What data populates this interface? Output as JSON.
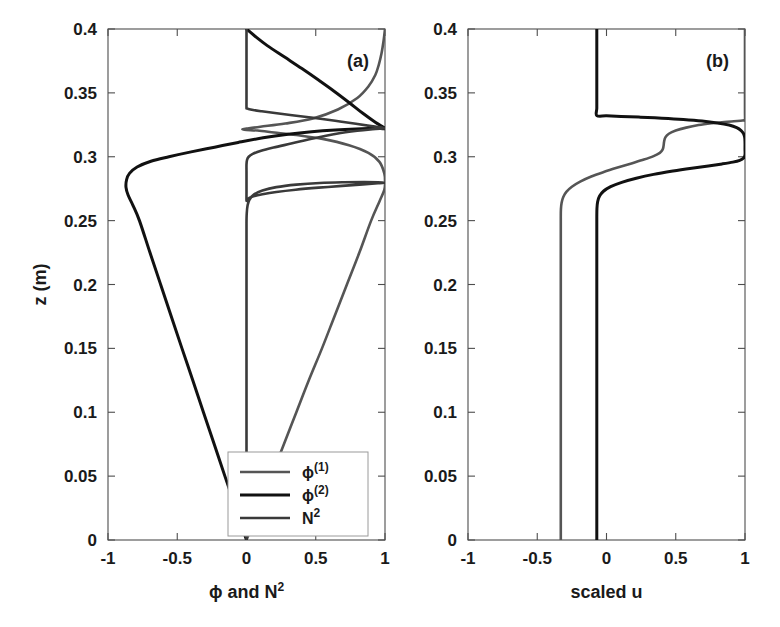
{
  "figure": {
    "width": 780,
    "height": 627,
    "background": "#ffffff"
  },
  "chart_data": [
    {
      "id": "panel-a",
      "type": "line",
      "panel_label": "(a)",
      "title": "",
      "xlabel": "ϕ and N²",
      "ylabel": "z (m)",
      "xlim": [
        -1,
        1
      ],
      "ylim": [
        0,
        0.4
      ],
      "xticks": [
        -1,
        -0.5,
        0,
        0.5,
        1
      ],
      "xticklabels": [
        "-1",
        "-0.5",
        "0",
        "0.5",
        "1"
      ],
      "yticks": [
        0,
        0.05,
        0.1,
        0.15,
        0.2,
        0.25,
        0.3,
        0.35,
        0.4
      ],
      "yticklabels": [
        "0",
        "0.05",
        "0.1",
        "0.15",
        "0.2",
        "0.25",
        "0.3",
        "0.35",
        "0.4"
      ],
      "grid": false,
      "legend_position": "lower right",
      "orientation": "x-is-value-y-is-depth",
      "series": [
        {
          "name": "ϕ⁽¹⁾",
          "legend_label": "ϕ<sup>(1)</sup>",
          "color": "#555555",
          "width": 2.6,
          "points": [
            [
              0.0,
              0.0
            ],
            [
              0.09,
              0.025
            ],
            [
              0.18,
              0.05
            ],
            [
              0.27,
              0.075
            ],
            [
              0.36,
              0.1
            ],
            [
              0.45,
              0.125
            ],
            [
              0.545,
              0.15
            ],
            [
              0.635,
              0.175
            ],
            [
              0.725,
              0.2
            ],
            [
              0.815,
              0.225
            ],
            [
              0.9,
              0.25
            ],
            [
              0.96,
              0.265
            ],
            [
              0.995,
              0.274
            ],
            [
              1.0,
              0.28
            ],
            [
              0.995,
              0.287
            ],
            [
              0.96,
              0.296
            ],
            [
              0.88,
              0.303
            ],
            [
              0.74,
              0.309
            ],
            [
              0.55,
              0.314
            ],
            [
              0.36,
              0.317
            ],
            [
              0.2,
              0.319
            ],
            [
              0.08,
              0.3205
            ],
            [
              0.0,
              0.321
            ],
            [
              -0.03,
              0.3215
            ],
            [
              0.0,
              0.322
            ],
            [
              0.1,
              0.3235
            ],
            [
              0.28,
              0.326
            ],
            [
              0.48,
              0.33
            ],
            [
              0.66,
              0.337
            ],
            [
              0.8,
              0.346
            ],
            [
              0.88,
              0.355
            ],
            [
              0.93,
              0.364
            ],
            [
              0.955,
              0.372
            ],
            [
              0.975,
              0.381
            ],
            [
              0.99,
              0.391
            ],
            [
              1.0,
              0.4
            ]
          ]
        },
        {
          "name": "ϕ⁽²⁾",
          "legend_label": "ϕ<sup>(2)</sup>",
          "color": "#111111",
          "width": 3.0,
          "points": [
            [
              0.0,
              0.0
            ],
            [
              -0.078,
              0.025
            ],
            [
              -0.156,
              0.05
            ],
            [
              -0.233,
              0.075
            ],
            [
              -0.311,
              0.1
            ],
            [
              -0.388,
              0.125
            ],
            [
              -0.466,
              0.15
            ],
            [
              -0.543,
              0.175
            ],
            [
              -0.62,
              0.2
            ],
            [
              -0.697,
              0.225
            ],
            [
              -0.773,
              0.25
            ],
            [
              -0.82,
              0.262
            ],
            [
              -0.855,
              0.27
            ],
            [
              -0.87,
              0.276
            ],
            [
              -0.866,
              0.282
            ],
            [
              -0.845,
              0.287
            ],
            [
              -0.79,
              0.292
            ],
            [
              -0.69,
              0.2965
            ],
            [
              -0.56,
              0.3
            ],
            [
              -0.4,
              0.3038
            ],
            [
              -0.23,
              0.3075
            ],
            [
              -0.06,
              0.3112
            ],
            [
              0.12,
              0.3148
            ],
            [
              0.3,
              0.3176
            ],
            [
              0.47,
              0.3196
            ],
            [
              0.64,
              0.321
            ],
            [
              0.79,
              0.3218
            ],
            [
              0.9,
              0.3221
            ],
            [
              0.965,
              0.3222
            ],
            [
              1.0,
              0.3222
            ],
            [
              0.93,
              0.327
            ],
            [
              0.84,
              0.334
            ],
            [
              0.74,
              0.3425
            ],
            [
              0.63,
              0.3515
            ],
            [
              0.52,
              0.36
            ],
            [
              0.4,
              0.369
            ],
            [
              0.275,
              0.378
            ],
            [
              0.15,
              0.387
            ],
            [
              0.06,
              0.3945
            ],
            [
              0.0,
              0.4
            ]
          ]
        },
        {
          "name": "N²",
          "legend_label": "N<sup>2</sup>",
          "color": "#3a3a3a",
          "width": 2.6,
          "points": [
            [
              0.0,
              0.0
            ],
            [
              0.0,
              0.08
            ],
            [
              0.0,
              0.16
            ],
            [
              0.0,
              0.22
            ],
            [
              0.0,
              0.248
            ],
            [
              0.002,
              0.256
            ],
            [
              0.008,
              0.262
            ],
            [
              0.022,
              0.2665
            ],
            [
              0.055,
              0.2705
            ],
            [
              0.115,
              0.2735
            ],
            [
              0.215,
              0.2762
            ],
            [
              0.36,
              0.2782
            ],
            [
              0.53,
              0.2795
            ],
            [
              0.7,
              0.28
            ],
            [
              0.85,
              0.2801
            ],
            [
              0.95,
              0.28
            ],
            [
              1.0,
              0.2797
            ],
            [
              0.95,
              0.2792
            ],
            [
              0.84,
              0.2784
            ],
            [
              0.69,
              0.2772
            ],
            [
              0.52,
              0.2758
            ],
            [
              0.355,
              0.2742
            ],
            [
              0.215,
              0.2724
            ],
            [
              0.115,
              0.2706
            ],
            [
              0.05,
              0.269
            ],
            [
              0.018,
              0.2676
            ],
            [
              0.004,
              0.2665
            ],
            [
              0.0,
              0.2658
            ],
            [
              0.0,
              0.272
            ],
            [
              0.0,
              0.28
            ],
            [
              0.0,
              0.288
            ],
            [
              0.0,
              0.294
            ],
            [
              0.004,
              0.2975
            ],
            [
              0.016,
              0.3
            ],
            [
              0.045,
              0.3022
            ],
            [
              0.1,
              0.3045
            ],
            [
              0.195,
              0.3072
            ],
            [
              0.33,
              0.3105
            ],
            [
              0.49,
              0.3145
            ],
            [
              0.65,
              0.318
            ],
            [
              0.8,
              0.3203
            ],
            [
              0.91,
              0.3215
            ],
            [
              0.975,
              0.322
            ],
            [
              1.0,
              0.3222
            ],
            [
              0.975,
              0.3228
            ],
            [
              0.9,
              0.324
            ],
            [
              0.79,
              0.3258
            ],
            [
              0.64,
              0.3282
            ],
            [
              0.48,
              0.3305
            ],
            [
              0.33,
              0.3325
            ],
            [
              0.205,
              0.3342
            ],
            [
              0.11,
              0.3356
            ],
            [
              0.048,
              0.3366
            ],
            [
              0.014,
              0.3374
            ],
            [
              0.002,
              0.338
            ],
            [
              0.0,
              0.3384
            ],
            [
              0.0,
              0.345
            ],
            [
              0.0,
              0.356
            ],
            [
              0.0,
              0.37
            ],
            [
              0.0,
              0.385
            ],
            [
              0.0,
              0.4
            ]
          ]
        }
      ]
    },
    {
      "id": "panel-b",
      "type": "line",
      "panel_label": "(b)",
      "title": "",
      "xlabel": "scaled u",
      "ylabel": "",
      "xlim": [
        -1,
        1
      ],
      "ylim": [
        0,
        0.4
      ],
      "xticks": [
        -1,
        -0.5,
        0,
        0.5,
        1
      ],
      "xticklabels": [
        "-1",
        "-0.5",
        "0",
        "0.5",
        "1"
      ],
      "yticks": [
        0,
        0.05,
        0.1,
        0.15,
        0.2,
        0.25,
        0.3,
        0.35,
        0.4
      ],
      "yticklabels": [
        "0",
        "0.05",
        "0.1",
        "0.15",
        "0.2",
        "0.25",
        "0.3",
        "0.35",
        "0.4"
      ],
      "grid": false,
      "legend_position": "none",
      "orientation": "x-is-value-y-is-depth",
      "series": [
        {
          "name": "scaled-u-mode-1",
          "color": "#555555",
          "width": 2.6,
          "points": [
            [
              -0.33,
              0.0
            ],
            [
              -0.33,
              0.05
            ],
            [
              -0.33,
              0.1
            ],
            [
              -0.33,
              0.15
            ],
            [
              -0.33,
              0.2
            ],
            [
              -0.33,
              0.235
            ],
            [
              -0.33,
              0.252
            ],
            [
              -0.329,
              0.259
            ],
            [
              -0.324,
              0.264
            ],
            [
              -0.312,
              0.2685
            ],
            [
              -0.29,
              0.2725
            ],
            [
              -0.25,
              0.2765
            ],
            [
              -0.19,
              0.2805
            ],
            [
              -0.11,
              0.2845
            ],
            [
              -0.02,
              0.288
            ],
            [
              0.08,
              0.2915
            ],
            [
              0.18,
              0.2948
            ],
            [
              0.27,
              0.2978
            ],
            [
              0.34,
              0.3005
            ],
            [
              0.385,
              0.303
            ],
            [
              0.405,
              0.3055
            ],
            [
              0.412,
              0.3085
            ],
            [
              0.416,
              0.312
            ],
            [
              0.425,
              0.3152
            ],
            [
              0.45,
              0.318
            ],
            [
              0.5,
              0.3205
            ],
            [
              0.575,
              0.3228
            ],
            [
              0.665,
              0.3248
            ],
            [
              0.76,
              0.3262
            ],
            [
              0.85,
              0.3272
            ],
            [
              0.92,
              0.3278
            ],
            [
              0.968,
              0.3282
            ],
            [
              0.992,
              0.3285
            ],
            [
              1.0,
              0.3288
            ],
            [
              1.0,
              0.335
            ],
            [
              1.0,
              0.345
            ],
            [
              1.0,
              0.358
            ],
            [
              1.0,
              0.372
            ],
            [
              1.0,
              0.387
            ],
            [
              1.0,
              0.4
            ]
          ]
        },
        {
          "name": "scaled-u-mode-2",
          "color": "#111111",
          "width": 3.0,
          "points": [
            [
              -0.07,
              0.0
            ],
            [
              -0.07,
              0.05
            ],
            [
              -0.07,
              0.1
            ],
            [
              -0.07,
              0.15
            ],
            [
              -0.07,
              0.2
            ],
            [
              -0.07,
              0.235
            ],
            [
              -0.07,
              0.252
            ],
            [
              -0.069,
              0.2595
            ],
            [
              -0.064,
              0.2648
            ],
            [
              -0.05,
              0.2692
            ],
            [
              -0.022,
              0.273
            ],
            [
              0.03,
              0.2766
            ],
            [
              0.11,
              0.28
            ],
            [
              0.215,
              0.2832
            ],
            [
              0.34,
              0.2862
            ],
            [
              0.48,
              0.2888
            ],
            [
              0.615,
              0.291
            ],
            [
              0.735,
              0.2928
            ],
            [
              0.835,
              0.2944
            ],
            [
              0.912,
              0.2958
            ],
            [
              0.962,
              0.2972
            ],
            [
              0.99,
              0.299
            ],
            [
              1.0,
              0.3015
            ],
            [
              1.0,
              0.306
            ],
            [
              1.0,
              0.311
            ],
            [
              0.998,
              0.315
            ],
            [
              0.99,
              0.318
            ],
            [
              0.972,
              0.3205
            ],
            [
              0.94,
              0.3228
            ],
            [
              0.885,
              0.3248
            ],
            [
              0.8,
              0.3265
            ],
            [
              0.69,
              0.328
            ],
            [
              0.555,
              0.3292
            ],
            [
              0.4,
              0.3302
            ],
            [
              0.245,
              0.331
            ],
            [
              0.105,
              0.3316
            ],
            [
              0.0,
              0.332
            ],
            [
              -0.07,
              0.3322
            ],
            [
              -0.07,
              0.338
            ],
            [
              -0.07,
              0.348
            ],
            [
              -0.07,
              0.36
            ],
            [
              -0.07,
              0.374
            ],
            [
              -0.07,
              0.388
            ],
            [
              -0.07,
              0.4
            ]
          ]
        }
      ]
    }
  ],
  "layout": {
    "panel_a": {
      "x": 108,
      "y": 29,
      "w": 277,
      "h": 511
    },
    "panel_b": {
      "x": 468,
      "y": 29,
      "w": 277,
      "h": 511
    }
  },
  "legend": {
    "items": [
      {
        "label_html": "ϕ<sup>(1)</sup>",
        "color": "#555555",
        "width": 2.6
      },
      {
        "label_html": "ϕ<sup>(2)</sup>",
        "color": "#111111",
        "width": 3.2
      },
      {
        "label_html": "N<sup>2</sup>",
        "color": "#3a3a3a",
        "width": 2.6
      }
    ],
    "box": {
      "x": 228,
      "y": 452,
      "w": 140,
      "h": 84
    }
  }
}
